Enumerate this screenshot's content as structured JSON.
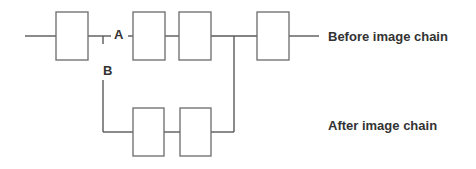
{
  "diagram": {
    "title": "",
    "labels": {
      "point_a": "A",
      "point_b": "B",
      "before_chain": "Before image chain",
      "after_chain": "After image chain"
    },
    "colors": {
      "line": "#5a5a5a",
      "box_border": "#6a6a6a",
      "text": "#333333",
      "background": "#ffffff"
    },
    "top_chain": {
      "boxes": [
        {
          "id": "box-1",
          "x": 56,
          "y": 12,
          "w": 32,
          "h": 48
        },
        {
          "id": "box-2",
          "x": 133,
          "y": 12,
          "w": 32,
          "h": 48
        },
        {
          "id": "box-3",
          "x": 179,
          "y": 12,
          "w": 32,
          "h": 48
        },
        {
          "id": "box-4",
          "x": 257,
          "y": 12,
          "w": 32,
          "h": 48
        }
      ]
    },
    "bottom_chain": {
      "boxes": [
        {
          "id": "box-5",
          "x": 133,
          "y": 108,
          "w": 31,
          "h": 48
        },
        {
          "id": "box-6",
          "x": 180,
          "y": 108,
          "w": 31,
          "h": 48
        }
      ]
    }
  }
}
